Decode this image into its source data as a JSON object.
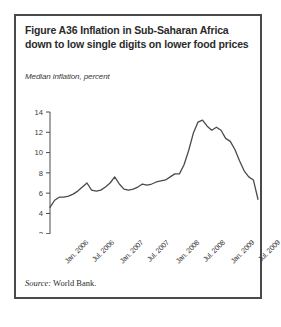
{
  "figure": {
    "title": "Figure A36  Inflation in Sub-Saharan Africa down to low single digits on lower food prices",
    "source_label": "Source:",
    "source_text": " World Bank.",
    "border_color": "#4a4a4a",
    "line_color": "#4a4a4a",
    "background": "#ffffff"
  },
  "chart_data": {
    "type": "line",
    "title": "Figure A36  Inflation in Sub-Saharan Africa down to low single digits on lower food prices",
    "subtitle": "Median inflation, percent",
    "xlabel": "",
    "ylabel": "Median inflation, percent",
    "ylim": [
      0,
      14
    ],
    "yticks": [
      0,
      2,
      4,
      6,
      8,
      10,
      12,
      14
    ],
    "ytick_labels": [
      "0",
      "2",
      "4",
      "6",
      "8",
      "10",
      "12",
      "14"
    ],
    "xtick_labels": [
      "Jan. 2006",
      "Jul. 2006",
      "Jan. 2007",
      "Jul. 2007",
      "Jan. 2008",
      "Jul. 2008",
      "Jan. 2009",
      "Jul. 2009"
    ],
    "xtick_indices": [
      0,
      6,
      12,
      18,
      24,
      30,
      36,
      42
    ],
    "grid": false,
    "legend": "none",
    "x": [
      "Jan. 2006",
      "Feb. 2006",
      "Mar. 2006",
      "Apr. 2006",
      "May 2006",
      "Jun. 2006",
      "Jul. 2006",
      "Aug. 2006",
      "Sep. 2006",
      "Oct. 2006",
      "Nov. 2006",
      "Dec. 2006",
      "Jan. 2007",
      "Feb. 2007",
      "Mar. 2007",
      "Apr. 2007",
      "May 2007",
      "Jun. 2007",
      "Jul. 2007",
      "Aug. 2007",
      "Sep. 2007",
      "Oct. 2007",
      "Nov. 2007",
      "Dec. 2007",
      "Jan. 2008",
      "Feb. 2008",
      "Mar. 2008",
      "Apr. 2008",
      "May 2008",
      "Jun. 2008",
      "Jul. 2008",
      "Aug. 2008",
      "Sep. 2008",
      "Oct. 2008",
      "Nov. 2008",
      "Dec. 2008",
      "Jan. 2009",
      "Feb. 2009",
      "Mar. 2009",
      "Apr. 2009",
      "May 2009",
      "Jun. 2009",
      "Jul. 2009",
      "Aug. 2009",
      "Sep. 2009",
      "Oct. 2009"
    ],
    "series": [
      {
        "name": "Median inflation",
        "values": [
          4.6,
          5.3,
          5.6,
          5.6,
          5.7,
          5.9,
          6.2,
          6.6,
          7.0,
          6.3,
          6.2,
          6.3,
          6.6,
          7.0,
          7.6,
          6.9,
          6.4,
          6.3,
          6.4,
          6.6,
          6.9,
          6.8,
          6.9,
          7.1,
          7.2,
          7.3,
          7.6,
          7.9,
          7.9,
          8.8,
          10.2,
          11.9,
          13.0,
          13.2,
          12.6,
          12.2,
          12.5,
          12.2,
          11.4,
          11.1,
          10.3,
          9.2,
          8.2,
          7.6,
          7.3,
          5.4
        ]
      }
    ],
    "peak": {
      "label": "Oct. 2008",
      "value": 13.2
    },
    "end_value": 3.6,
    "start_value": 4.6
  }
}
